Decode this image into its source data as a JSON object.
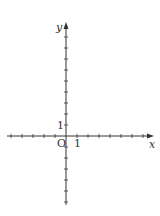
{
  "diagram": {
    "type": "cartesian-coordinate-plane",
    "x_axis_label": "x",
    "y_axis_label": "y",
    "origin_label": "O",
    "x_unit_label": "1",
    "y_unit_label": "1",
    "x_range": [
      -5,
      7
    ],
    "y_range": [
      -6,
      9
    ],
    "tick_step": 1,
    "axis_color": "#333333"
  }
}
